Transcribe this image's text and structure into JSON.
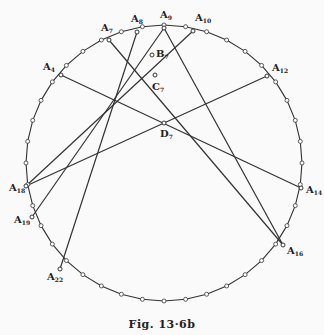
{
  "caption": "Fig. 13·6b",
  "circle": {
    "cx": 164,
    "cy": 163,
    "r": 138
  },
  "vertices": [
    {
      "id": "A4",
      "label": "A",
      "sub": "4",
      "x": 61,
      "y": 75,
      "lx": 43,
      "ly": 70
    },
    {
      "id": "A7",
      "label": "A",
      "sub": "7",
      "x": 109,
      "y": 40,
      "lx": 101,
      "ly": 31
    },
    {
      "id": "A8",
      "label": "A",
      "sub": "8",
      "x": 137,
      "y": 32,
      "lx": 131,
      "ly": 22
    },
    {
      "id": "A9",
      "label": "A",
      "sub": "9",
      "x": 164,
      "y": 28,
      "lx": 160,
      "ly": 18
    },
    {
      "id": "A10",
      "label": "A",
      "sub": "10",
      "x": 193,
      "y": 31,
      "lx": 195,
      "ly": 21
    },
    {
      "id": "A12",
      "label": "A",
      "sub": "12",
      "x": 267,
      "y": 76,
      "lx": 272,
      "ly": 71
    },
    {
      "id": "A14",
      "label": "A",
      "sub": "14",
      "x": 301,
      "y": 188,
      "lx": 306,
      "ly": 193
    },
    {
      "id": "A16",
      "label": "A",
      "sub": "16",
      "x": 283,
      "y": 245,
      "lx": 287,
      "ly": 254
    },
    {
      "id": "A18",
      "label": "A",
      "sub": "18",
      "x": 26,
      "y": 186,
      "lx": 9,
      "ly": 191
    },
    {
      "id": "A19",
      "label": "A",
      "sub": "19",
      "x": 32,
      "y": 217,
      "lx": 14,
      "ly": 223
    },
    {
      "id": "A22",
      "label": "A",
      "sub": "22",
      "x": 60,
      "y": 269,
      "lx": 47,
      "ly": 280
    }
  ],
  "points": [
    {
      "id": "B7",
      "label": "B",
      "sub": "7",
      "x": 152,
      "y": 55,
      "lx": 156,
      "ly": 57
    },
    {
      "id": "C7",
      "label": "C",
      "sub": "7",
      "x": 155,
      "y": 75,
      "lx": 152,
      "ly": 90
    },
    {
      "id": "D7",
      "label": "D",
      "sub": "7",
      "x": 164,
      "y": 123,
      "lx": 160,
      "ly": 137
    }
  ],
  "chords": [
    [
      "A4",
      "A14"
    ],
    [
      "A7",
      "A16"
    ],
    [
      "A8",
      "A22"
    ],
    [
      "A9",
      "A19"
    ],
    [
      "A10",
      "A18"
    ],
    [
      "A12",
      "A18"
    ],
    [
      "A9",
      "A16"
    ]
  ],
  "polygon_sides": 40
}
